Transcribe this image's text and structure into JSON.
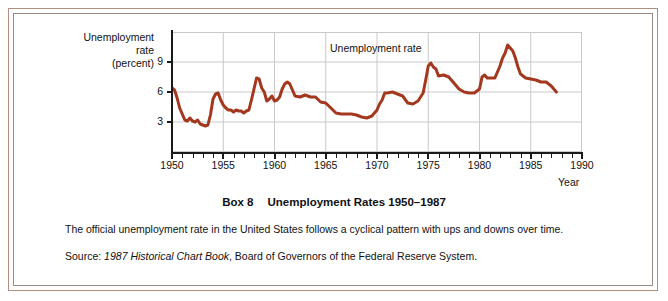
{
  "frame": {
    "outer_border_color": "#b08f7e",
    "inner_border_color": "#9a8a85",
    "background": "#ffffff"
  },
  "caption": {
    "box_label": "Box 8",
    "title": "Unemployment Rates 1950–1987",
    "body": "The official unemployment rate in the United States follows a cyclical pattern with ups and downs over time.",
    "source_prefix": "Source:",
    "source_italic": "1987 Historical Chart Book",
    "source_rest": ", Board of Governors of the Federal Reserve System."
  },
  "chart_data": {
    "type": "line",
    "title": "",
    "annotation": "Unemployment rate",
    "ylabel_lines": [
      "Unemployment",
      "rate",
      "(percent)"
    ],
    "ylabel": "Unemployment rate (percent)",
    "xlabel": "Year",
    "xlim": [
      1950,
      1990
    ],
    "ylim": [
      0,
      12
    ],
    "yticks": [
      3,
      6,
      9
    ],
    "ytick_labels": [
      "3",
      "6",
      "9"
    ],
    "xticks": [
      1950,
      1955,
      1960,
      1965,
      1970,
      1975,
      1980,
      1985,
      1990
    ],
    "xtick_labels": [
      "1950",
      "1955",
      "1960",
      "1965",
      "1970",
      "1975",
      "1980",
      "1985",
      "1990"
    ],
    "x_minor_tick_interval": 1,
    "grid": "both",
    "grid_color": "#c9c9c9",
    "legend": "none",
    "line_color": "#a4381f",
    "line_width": 3,
    "series": [
      {
        "name": "Unemployment rate",
        "x": [
          1950.0,
          1950.25,
          1950.5,
          1950.75,
          1951.0,
          1951.25,
          1951.5,
          1951.75,
          1952.0,
          1952.25,
          1952.5,
          1952.75,
          1953.0,
          1953.25,
          1953.5,
          1953.75,
          1954.0,
          1954.25,
          1954.5,
          1954.75,
          1955.0,
          1955.25,
          1955.5,
          1955.75,
          1956.0,
          1956.25,
          1956.5,
          1956.75,
          1957.0,
          1957.25,
          1957.5,
          1957.75,
          1958.0,
          1958.25,
          1958.5,
          1958.75,
          1959.0,
          1959.25,
          1959.5,
          1959.75,
          1960.0,
          1960.25,
          1960.5,
          1960.75,
          1961.0,
          1961.25,
          1961.5,
          1961.75,
          1962.0,
          1962.5,
          1963.0,
          1963.5,
          1964.0,
          1964.5,
          1965.0,
          1965.5,
          1966.0,
          1966.5,
          1967.0,
          1967.5,
          1968.0,
          1968.5,
          1969.0,
          1969.5,
          1970.0,
          1970.25,
          1970.5,
          1970.75,
          1971.0,
          1971.5,
          1972.0,
          1972.5,
          1973.0,
          1973.5,
          1974.0,
          1974.25,
          1974.5,
          1974.75,
          1975.0,
          1975.25,
          1975.5,
          1975.75,
          1976.0,
          1976.5,
          1977.0,
          1977.5,
          1978.0,
          1978.5,
          1979.0,
          1979.5,
          1980.0,
          1980.25,
          1980.5,
          1980.75,
          1981.0,
          1981.5,
          1982.0,
          1982.25,
          1982.5,
          1982.75,
          1983.0,
          1983.25,
          1983.5,
          1983.75,
          1984.0,
          1984.5,
          1985.0,
          1985.5,
          1986.0,
          1986.5,
          1987.0,
          1987.5
        ],
        "values": [
          6.4,
          6.2,
          5.4,
          4.4,
          3.8,
          3.2,
          3.1,
          3.4,
          3.1,
          3.0,
          3.2,
          2.8,
          2.7,
          2.6,
          2.7,
          3.7,
          5.3,
          5.8,
          5.9,
          5.2,
          4.7,
          4.4,
          4.2,
          4.2,
          4.0,
          4.2,
          4.1,
          4.1,
          3.9,
          4.1,
          4.2,
          5.2,
          6.3,
          7.4,
          7.3,
          6.4,
          6.0,
          5.1,
          5.3,
          5.6,
          5.1,
          5.2,
          5.5,
          6.3,
          6.8,
          7.0,
          6.8,
          6.2,
          5.6,
          5.5,
          5.7,
          5.5,
          5.5,
          5.0,
          4.9,
          4.4,
          3.9,
          3.8,
          3.8,
          3.8,
          3.7,
          3.5,
          3.4,
          3.6,
          4.2,
          4.8,
          5.2,
          5.9,
          5.9,
          6.0,
          5.8,
          5.6,
          4.9,
          4.8,
          5.1,
          5.5,
          5.9,
          7.2,
          8.6,
          8.9,
          8.5,
          8.3,
          7.6,
          7.7,
          7.5,
          6.9,
          6.3,
          6.0,
          5.9,
          5.9,
          6.3,
          7.5,
          7.7,
          7.4,
          7.4,
          7.4,
          8.6,
          9.4,
          9.9,
          10.7,
          10.4,
          10.1,
          9.4,
          8.5,
          7.8,
          7.4,
          7.3,
          7.2,
          7.0,
          7.0,
          6.6,
          6.0
        ]
      }
    ]
  }
}
